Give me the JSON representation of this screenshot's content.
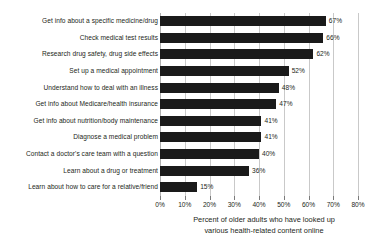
{
  "chart_data": {
    "type": "bar",
    "orientation": "horizontal",
    "title": "",
    "subtitle": "",
    "xlabel_lines": [
      "Percent of older adults who have looked up",
      "various health-related content online"
    ],
    "ylabel": "",
    "xlim": [
      0,
      80
    ],
    "grid": true,
    "legend": "none",
    "bar_color": "#1a1a1a",
    "gridline_color": "#c9c9c9",
    "xticks": [
      0,
      10,
      20,
      30,
      40,
      50,
      60,
      70,
      80
    ],
    "xtick_labels": [
      "0%",
      "10%",
      "20%",
      "30%",
      "40%",
      "50%",
      "60%",
      "70%",
      "80%"
    ],
    "categories": [
      "Get info about a specific medicine/drug",
      "Check medical test results",
      "Research drug safety, drug side effects",
      "Set up a medical appointment",
      "Understand how to deal with an illness",
      "Get info about Medicare/health insurance",
      "Get info about nutrition/body maintenance",
      "Diagnose a medical problem",
      "Contact a doctor's care team with a question",
      "Learn about a drug or treatment",
      "Learn about how to care for a relative/friend"
    ],
    "values": [
      67,
      66,
      62,
      52,
      48,
      47,
      41,
      41,
      40,
      36,
      15
    ],
    "value_labels": [
      "67%",
      "66%",
      "62%",
      "52%",
      "48%",
      "47%",
      "41%",
      "41%",
      "40%",
      "36%",
      "15%"
    ]
  }
}
